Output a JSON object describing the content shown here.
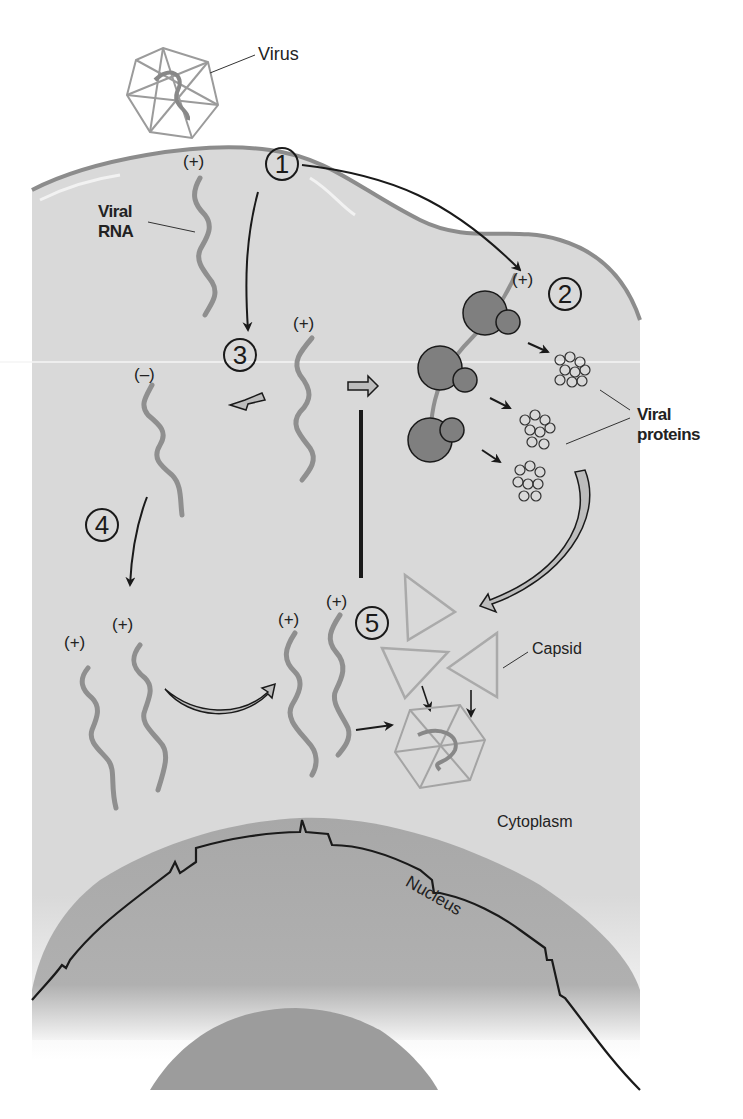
{
  "figure": {
    "type": "viral replication cycle (positive-strand RNA virus)",
    "colors": {
      "cytoplasm": "#d9d9d9",
      "membrane": "#8c8c8c",
      "nucleus": "#a9a9a9",
      "nucleolus": "#9a9a9a",
      "rna": "#8f8f8f",
      "ribosome": "#7a7a7a",
      "outline": "#1a1a1a"
    }
  },
  "labels": {
    "virus": "Virus",
    "viral_rna_line1": "Viral",
    "viral_rna_line2": "RNA",
    "viral_proteins_line1": "Viral",
    "viral_proteins_line2": "proteins",
    "capsid": "Capsid",
    "cytoplasm": "Cytoplasm",
    "nucleus": "Nucleus"
  },
  "steps": [
    {
      "number": "1"
    },
    {
      "number": "2"
    },
    {
      "number": "3"
    },
    {
      "number": "4"
    },
    {
      "number": "5"
    }
  ],
  "strand_signs": {
    "plus": "(+)",
    "minus": "(–)"
  }
}
